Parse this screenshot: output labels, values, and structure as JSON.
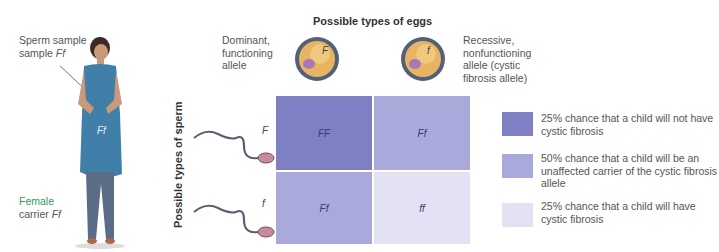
{
  "woman": {
    "sperm_sample_label": "Sperm sample",
    "sperm_sample_genotype": "Ff",
    "shirt_genotype": "Ff",
    "female_label": "Female",
    "carrier_label": "carrier",
    "carrier_genotype": "Ff"
  },
  "eggs": {
    "title": "Possible types of eggs",
    "dominant_label": [
      "Dominant,",
      "functioning",
      "allele"
    ],
    "recessive_label": [
      "Recessive,",
      "nonfunctioning",
      "allele (cystic",
      "fibrosis allele)"
    ],
    "egg1_allele": "F",
    "egg2_allele": "f"
  },
  "sperm": {
    "title": "Possible types of sperm",
    "sperm1_allele": "F",
    "sperm2_allele": "f"
  },
  "punnett": {
    "cells": [
      {
        "genotype": "FF",
        "color": "#7f7fc4"
      },
      {
        "genotype": "Ff",
        "color": "#aaa9db"
      },
      {
        "genotype": "Ff",
        "color": "#aaa9db"
      },
      {
        "genotype": "ff",
        "color": "#e3e2f4"
      }
    ]
  },
  "legend": [
    {
      "text": "25% chance that a child will not have cystic fibrosis",
      "color": "#7f7fc4"
    },
    {
      "text": "50% chance that a child will be an unaffected carrier of the cystic fibrosis allele",
      "color": "#aaa9db"
    },
    {
      "text": "25% chance that a child will have cystic fibrosis",
      "color": "#e3e2f4"
    }
  ]
}
